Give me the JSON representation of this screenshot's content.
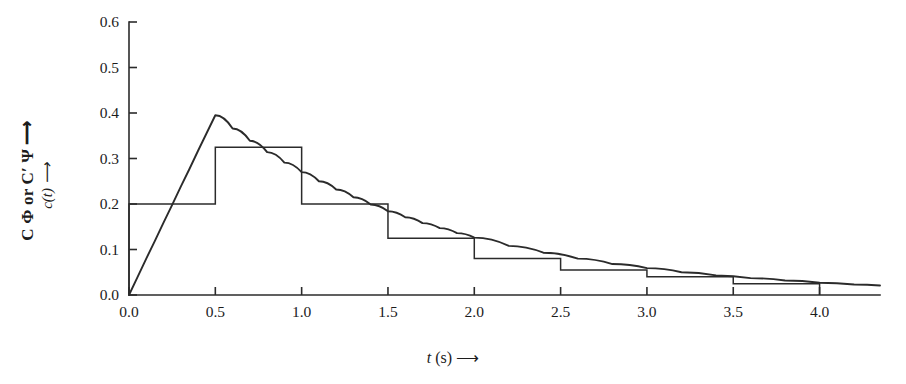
{
  "figure": {
    "background": "#ffffff",
    "line_color": "#2b2b2b",
    "axis_color": "#2b2b2b"
  },
  "axis_titles": {
    "y_outer": "C Φ or C′ Ψ ⟶",
    "y_inner_main": "c(t)",
    "y_inner_arrow": " ⟶",
    "x_main": "t",
    "x_rest": " (s) ⟶"
  },
  "chart_data": {
    "type": "line",
    "title": "",
    "subtitle": "",
    "xlabel": "t (s) ⟶",
    "ylabel": "c(t) ⟶",
    "ylabel_secondary": "C Φ or C′ Ψ ⟶",
    "xlim": [
      0.0,
      4.35
    ],
    "ylim": [
      0.0,
      0.6
    ],
    "xticks": [
      0.0,
      0.5,
      1.0,
      1.5,
      2.0,
      2.5,
      3.0,
      3.5,
      4.0
    ],
    "xtick_labels": [
      "0.0",
      "0.5",
      "1.0",
      "1.5",
      "2.0",
      "2.5",
      "3.0",
      "3.5",
      "4.0"
    ],
    "yticks": [
      0.0,
      0.1,
      0.2,
      0.3,
      0.4,
      0.5,
      0.6
    ],
    "ytick_labels": [
      "0.0",
      "0.1",
      "0.2",
      "0.3",
      "0.4",
      "0.5",
      "0.6"
    ],
    "grid": false,
    "legend": null,
    "tick_direction": "in",
    "spines": [
      "left",
      "bottom"
    ],
    "series": [
      {
        "name": "smooth response curve",
        "type": "line",
        "x": [
          0.0,
          0.05,
          0.1,
          0.15,
          0.2,
          0.25,
          0.3,
          0.35,
          0.4,
          0.45,
          0.5,
          0.6,
          0.7,
          0.8,
          0.9,
          1.0,
          1.1,
          1.2,
          1.3,
          1.4,
          1.5,
          1.6,
          1.7,
          1.8,
          1.9,
          2.0,
          2.2,
          2.4,
          2.6,
          2.8,
          3.0,
          3.2,
          3.4,
          3.6,
          3.8,
          4.0,
          4.2,
          4.35
        ],
        "y": [
          0.0,
          0.04,
          0.08,
          0.119,
          0.159,
          0.198,
          0.238,
          0.277,
          0.317,
          0.356,
          0.395,
          0.366,
          0.339,
          0.314,
          0.291,
          0.27,
          0.25,
          0.232,
          0.215,
          0.199,
          0.184,
          0.171,
          0.158,
          0.147,
          0.136,
          0.126,
          0.108,
          0.093,
          0.08,
          0.068,
          0.059,
          0.05,
          0.043,
          0.037,
          0.032,
          0.027,
          0.023,
          0.021
        ]
      },
      {
        "name": "measured step histogram",
        "type": "step",
        "bin_edges": [
          0.0,
          0.5,
          1.0,
          1.5,
          2.0,
          2.5,
          3.0,
          3.5,
          4.0
        ],
        "values": [
          0.2,
          0.325,
          0.2,
          0.125,
          0.08,
          0.055,
          0.04,
          0.025
        ]
      }
    ]
  }
}
